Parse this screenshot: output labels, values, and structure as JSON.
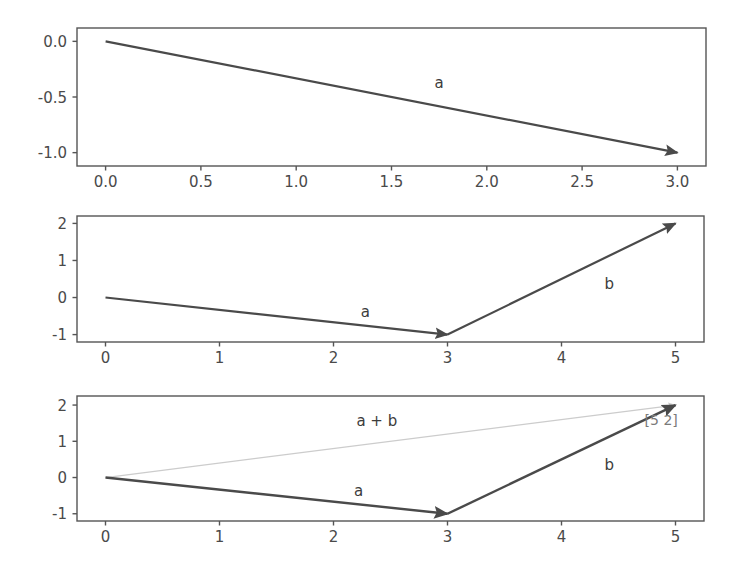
{
  "figure": {
    "title": "",
    "background_color": "#ffffff",
    "width": 740,
    "height": 572,
    "axes_color": "#555555",
    "vector_a_color": "#4a4a4a",
    "vector_b_color": "#4a4a4a",
    "vector_sum_color": "#cccccc"
  },
  "chart_data": [
    {
      "type": "line",
      "title": "",
      "xlabel": "",
      "ylabel": "",
      "xlim": [
        -0.15,
        3.15
      ],
      "ylim": [
        -1.12,
        0.12
      ],
      "xticks": [
        "0.0",
        "0.5",
        "1.0",
        "1.5",
        "2.0",
        "2.5",
        "3.0"
      ],
      "xtick_values": [
        0.0,
        0.5,
        1.0,
        1.5,
        2.0,
        2.5,
        3.0
      ],
      "yticks": [
        "0.0",
        "-0.5",
        "-1.0"
      ],
      "ytick_values": [
        0.0,
        -0.5,
        -1.0
      ],
      "grid": false,
      "legend": "none",
      "vectors": [
        {
          "name": "a",
          "label": "a",
          "start": [
            0,
            0
          ],
          "end": [
            3,
            -1
          ],
          "color": "#4a4a4a",
          "width": 2.2,
          "arrow": true,
          "label_at": [
            1.75,
            -0.42
          ]
        }
      ],
      "annotations": []
    },
    {
      "type": "line",
      "title": "",
      "xlabel": "",
      "ylabel": "",
      "xlim": [
        -0.25,
        5.25
      ],
      "ylim": [
        -1.2,
        2.2
      ],
      "xticks": [
        "0",
        "1",
        "2",
        "3",
        "4",
        "5"
      ],
      "xtick_values": [
        0,
        1,
        2,
        3,
        4,
        5
      ],
      "yticks": [
        "2",
        "1",
        "0",
        "-1"
      ],
      "ytick_values": [
        2,
        1,
        0,
        -1
      ],
      "grid": false,
      "legend": "none",
      "vectors": [
        {
          "name": "a",
          "label": "a",
          "start": [
            0,
            0
          ],
          "end": [
            3,
            -1
          ],
          "color": "#4a4a4a",
          "width": 2.2,
          "arrow": true,
          "label_at": [
            2.28,
            -0.52
          ]
        },
        {
          "name": "b",
          "label": "b",
          "start": [
            3,
            -1
          ],
          "end": [
            5,
            2
          ],
          "color": "#4a4a4a",
          "width": 2.2,
          "arrow": true,
          "label_at": [
            4.42,
            0.22
          ]
        }
      ],
      "annotations": []
    },
    {
      "type": "line",
      "title": "",
      "xlabel": "",
      "ylabel": "",
      "xlim": [
        -0.25,
        5.25
      ],
      "ylim": [
        -1.2,
        2.25
      ],
      "xticks": [
        "0",
        "1",
        "2",
        "3",
        "4",
        "5"
      ],
      "xtick_values": [
        0,
        1,
        2,
        3,
        4,
        5
      ],
      "yticks": [
        "2",
        "1",
        "0",
        "-1"
      ],
      "ytick_values": [
        2,
        1,
        0,
        -1
      ],
      "grid": false,
      "legend": "none",
      "vectors": [
        {
          "name": "a",
          "label": "a",
          "start": [
            0,
            0
          ],
          "end": [
            3,
            -1
          ],
          "color": "#4a4a4a",
          "width": 2.4,
          "arrow": true,
          "label_at": [
            2.22,
            -0.5
          ]
        },
        {
          "name": "b",
          "label": "b",
          "start": [
            3,
            -1
          ],
          "end": [
            5,
            2
          ],
          "color": "#4a4a4a",
          "width": 2.4,
          "arrow": true,
          "label_at": [
            4.42,
            0.2
          ]
        },
        {
          "name": "a_plus_b",
          "label": "a + b",
          "start": [
            0,
            0
          ],
          "end": [
            5,
            2
          ],
          "color": "#cccccc",
          "width": 1.3,
          "arrow": true,
          "label_at": [
            2.38,
            1.42
          ]
        }
      ],
      "annotations": [
        {
          "text": "[5 2]",
          "at": [
            5.02,
            1.45
          ],
          "color": "#7a7a7a"
        }
      ]
    }
  ]
}
